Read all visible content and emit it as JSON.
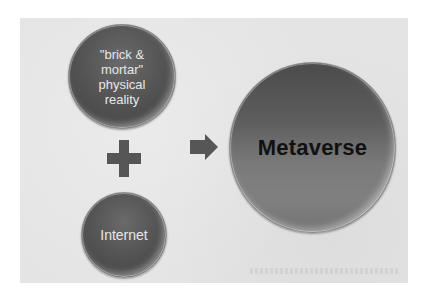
{
  "diagram": {
    "type": "concept-equation",
    "nodes": [
      {
        "id": "brick",
        "label": "\"brick &\nmortar\"\nphysical\nreality",
        "shape": "circle",
        "fill": "#555555",
        "text_color": "#e8e8e8"
      },
      {
        "id": "internet",
        "label": "Internet",
        "shape": "circle",
        "fill": "#555555",
        "text_color": "#e8e8e8"
      },
      {
        "id": "metaverse",
        "label": "Metaverse",
        "shape": "circle",
        "fill": "#6a6a6a",
        "text_color": "#111111"
      }
    ],
    "operators": [
      {
        "id": "plus",
        "symbol": "+",
        "between": [
          "brick",
          "internet"
        ]
      },
      {
        "id": "arrow",
        "symbol": "→",
        "from": [
          "brick",
          "internet"
        ],
        "to": "metaverse"
      }
    ],
    "colors": {
      "panel_background": "#e4e4e4",
      "page_background": "#ffffff",
      "operator_fill": "#565656"
    }
  }
}
